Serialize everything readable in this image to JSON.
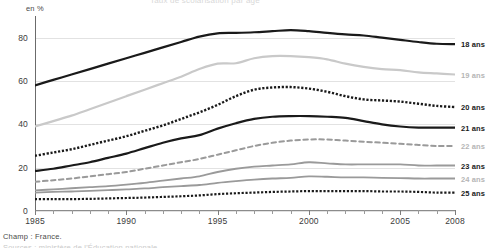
{
  "axis_unit_label": "en %",
  "title_cut": "Taux de scolarisation par âge",
  "caption": "Champ : France.",
  "caption_cut": "Sources : ministère de l'Éducation nationale.",
  "colors": {
    "dark": "#1a1a1a",
    "light_gray": "#c9c9c9",
    "mid_gray": "#8f8f8f",
    "grid": "#e2e2e2",
    "axis": "#7d7d7d"
  },
  "legend": [
    {
      "label": "18 ans",
      "muted": false
    },
    {
      "label": "19 ans",
      "muted": true
    },
    {
      "label": "20 ans",
      "muted": false
    },
    {
      "label": "21 ans",
      "muted": false
    },
    {
      "label": "22 ans",
      "muted": true
    },
    {
      "label": "23 ans",
      "muted": false
    },
    {
      "label": "24 ans",
      "muted": true
    },
    {
      "label": "25 ans",
      "muted": false
    }
  ],
  "chart_data": {
    "type": "line",
    "title": "Taux de scolarisation par âge",
    "xlabel": "",
    "ylabel": "en %",
    "xlim": [
      1985,
      2008
    ],
    "ylim": [
      0,
      90
    ],
    "yticks": [
      0,
      20,
      40,
      60,
      80
    ],
    "xticks": [
      1985,
      1986,
      1987,
      1988,
      1989,
      1990,
      1991,
      1992,
      1993,
      1994,
      1995,
      1996,
      1997,
      1998,
      1999,
      2000,
      2001,
      2002,
      2003,
      2004,
      2005,
      2006,
      2007,
      2008
    ],
    "xtick_labels": [
      "1985",
      "",
      "",
      "",
      "",
      "1990",
      "",
      "",
      "",
      "",
      "1995",
      "",
      "",
      "",
      "",
      "2000",
      "",
      "",
      "",
      "",
      "2005",
      "",
      "",
      "2008"
    ],
    "grid": true,
    "legend_position": "right",
    "x": [
      1985,
      1986,
      1987,
      1988,
      1989,
      1990,
      1991,
      1992,
      1993,
      1994,
      1995,
      1996,
      1997,
      1998,
      1999,
      2000,
      2001,
      2002,
      2003,
      2004,
      2005,
      2006,
      2007,
      2008
    ],
    "series": [
      {
        "name": "18 ans",
        "style": "solid",
        "width": 2.2,
        "color": "#1a1a1a",
        "values": [
          58,
          60.5,
          63,
          65.5,
          68,
          70.5,
          73,
          75.5,
          78,
          80.5,
          82,
          82.2,
          82.5,
          83,
          83.5,
          83,
          82.2,
          81.5,
          81,
          80,
          79,
          78,
          77.2,
          77
        ]
      },
      {
        "name": "19 ans",
        "style": "solid",
        "width": 2.2,
        "color": "#c9c9c9",
        "values": [
          39,
          41.5,
          44,
          47,
          50,
          53,
          56,
          59,
          62,
          65.5,
          68,
          68.2,
          70.5,
          71.5,
          71.5,
          71,
          70,
          68,
          66.5,
          65.5,
          65,
          64,
          63.5,
          63
        ]
      },
      {
        "name": "20 ans",
        "style": "dotted",
        "width": 2.4,
        "color": "#1a1a1a",
        "values": [
          25.5,
          27,
          28.5,
          30.5,
          32.5,
          34.5,
          37,
          39.5,
          42.5,
          45.5,
          49,
          53,
          56,
          57,
          57.2,
          56.5,
          55,
          53,
          51.5,
          51,
          50.5,
          49.5,
          48.5,
          48
        ]
      },
      {
        "name": "21 ans",
        "style": "solid",
        "width": 2.2,
        "color": "#1a1a1a",
        "values": [
          18.5,
          19.5,
          21,
          22.5,
          24.5,
          26.5,
          29,
          31.5,
          33.5,
          35,
          38,
          40.5,
          42.5,
          43.5,
          43.8,
          43.8,
          43.5,
          43,
          41.5,
          40,
          39,
          38.5,
          38.5,
          38.5
        ]
      },
      {
        "name": "22 ans",
        "style": "dashed",
        "width": 2.0,
        "color": "#9a9a9a",
        "values": [
          13.5,
          14.2,
          15,
          16,
          17,
          18,
          19.5,
          21,
          22.5,
          24,
          26,
          28,
          30,
          31.5,
          32.5,
          33,
          33,
          32.5,
          32,
          31.5,
          31,
          30.5,
          30,
          30
        ]
      },
      {
        "name": "23 ans",
        "style": "solid",
        "width": 1.8,
        "color": "#9a9a9a",
        "values": [
          9.5,
          10,
          10.5,
          11,
          11.5,
          12.2,
          13,
          14,
          15,
          16,
          18,
          19.5,
          20.5,
          21,
          21.5,
          22.5,
          22,
          21.5,
          21.5,
          21.5,
          21.5,
          21,
          21,
          21
        ]
      },
      {
        "name": "24 ans",
        "style": "solid",
        "width": 1.8,
        "color": "#9a9a9a",
        "values": [
          8.5,
          8.8,
          9,
          9.3,
          9.6,
          10,
          10.4,
          11,
          11.5,
          12,
          13,
          13.8,
          14.5,
          15,
          15.3,
          16,
          15.8,
          15.5,
          15.5,
          15.3,
          15.2,
          15,
          15,
          15
        ]
      },
      {
        "name": "25 ans",
        "style": "dotted",
        "width": 2.2,
        "color": "#1a1a1a",
        "values": [
          5.5,
          5.5,
          5.5,
          5.6,
          5.8,
          6,
          6.2,
          6.5,
          6.8,
          7.2,
          7.8,
          8.2,
          8.5,
          8.8,
          9,
          9.2,
          9.2,
          9.2,
          9.2,
          9,
          9,
          8.8,
          8.5,
          8.5
        ]
      }
    ]
  }
}
